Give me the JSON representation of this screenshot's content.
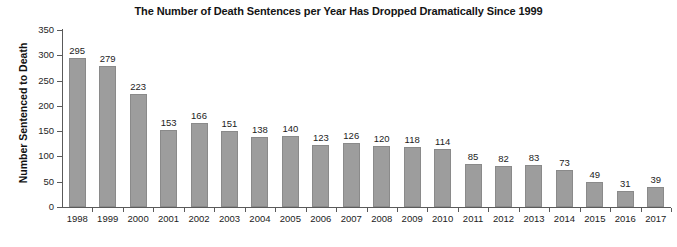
{
  "chart_data": {
    "type": "bar",
    "title": "The Number of Death Sentences per Year Has Dropped Dramatically Since 1999",
    "xlabel": "",
    "ylabel": "Number Sentenced to Death",
    "categories": [
      "1998",
      "1999",
      "2000",
      "2001",
      "2002",
      "2003",
      "2004",
      "2005",
      "2006",
      "2007",
      "2008",
      "2009",
      "2010",
      "2011",
      "2012",
      "2013",
      "2014",
      "2015",
      "2016",
      "2017"
    ],
    "values": [
      295,
      279,
      223,
      153,
      166,
      151,
      138,
      140,
      123,
      126,
      120,
      118,
      114,
      85,
      82,
      83,
      73,
      49,
      31,
      39
    ],
    "ylim": [
      0,
      350
    ],
    "yticks": [
      0,
      50,
      100,
      150,
      200,
      250,
      300,
      350
    ],
    "ytick_labels": [
      "0",
      "50",
      "100",
      "150",
      "200",
      "250",
      "300",
      "350"
    ],
    "grid": false,
    "legend": "none",
    "show_value_labels": true,
    "bar_color": "#9d9d9d",
    "bar_edge_color": "#8a8a8a",
    "axis_color": "#5a5a5a",
    "text_color": "#1c1c1c",
    "background_color": "#ffffff"
  }
}
